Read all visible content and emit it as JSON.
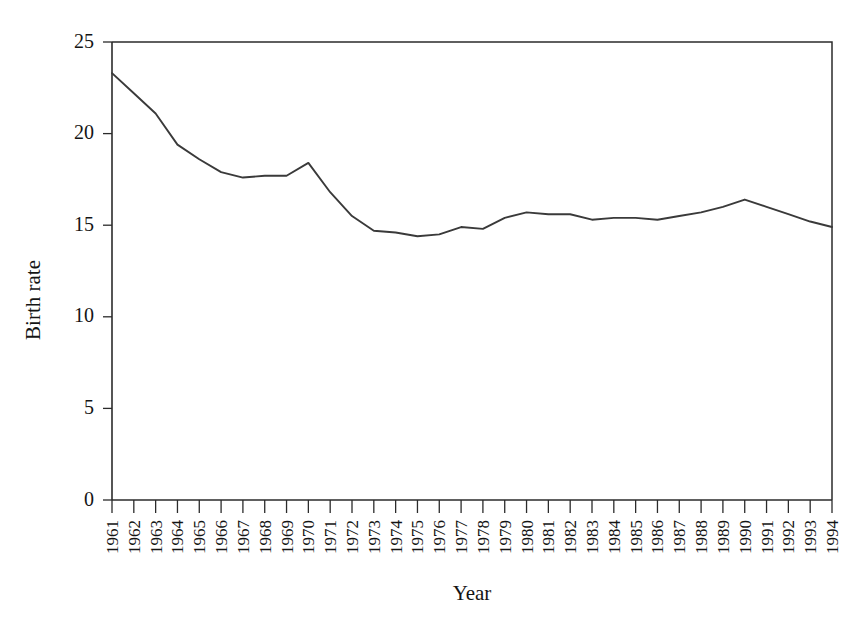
{
  "chart_data": {
    "type": "line",
    "title": "",
    "xlabel": "Year",
    "ylabel": "Birth rate",
    "xlim": [
      1961,
      1994
    ],
    "ylim": [
      0,
      25
    ],
    "yticks": [
      0,
      5,
      10,
      15,
      20,
      25
    ],
    "grid": false,
    "legend": false,
    "line_color": "#3a3a3a",
    "axis_color": "#2b2b2b",
    "background": "#ffffff",
    "categories": [
      "1961",
      "1962",
      "1963",
      "1964",
      "1965",
      "1966",
      "1967",
      "1968",
      "1969",
      "1970",
      "1971",
      "1972",
      "1973",
      "1974",
      "1975",
      "1976",
      "1977",
      "1978",
      "1979",
      "1980",
      "1981",
      "1982",
      "1983",
      "1984",
      "1985",
      "1986",
      "1987",
      "1988",
      "1989",
      "1990",
      "1991",
      "1992",
      "1993",
      "1994"
    ],
    "x": [
      1961,
      1962,
      1963,
      1964,
      1965,
      1966,
      1967,
      1968,
      1969,
      1970,
      1971,
      1972,
      1973,
      1974,
      1975,
      1976,
      1977,
      1978,
      1979,
      1980,
      1981,
      1982,
      1983,
      1984,
      1985,
      1986,
      1987,
      1988,
      1989,
      1990,
      1991,
      1992,
      1993,
      1994
    ],
    "values": [
      23.3,
      22.2,
      21.1,
      19.4,
      18.6,
      17.9,
      17.6,
      17.7,
      17.7,
      18.4,
      16.8,
      15.5,
      14.7,
      14.6,
      14.4,
      14.5,
      14.9,
      14.8,
      15.4,
      15.7,
      15.6,
      15.6,
      15.3,
      15.4,
      15.4,
      15.3,
      15.5,
      15.7,
      16.0,
      16.4,
      16.0,
      15.6,
      15.2,
      14.9
    ],
    "series": [
      {
        "name": "Birth rate",
        "values": [
          23.3,
          22.2,
          21.1,
          19.4,
          18.6,
          17.9,
          17.6,
          17.7,
          17.7,
          18.4,
          16.8,
          15.5,
          14.7,
          14.6,
          14.4,
          14.5,
          14.9,
          14.8,
          15.4,
          15.7,
          15.6,
          15.6,
          15.3,
          15.4,
          15.4,
          15.3,
          15.5,
          15.7,
          16.0,
          16.4,
          16.0,
          15.6,
          15.2,
          14.9
        ]
      }
    ]
  },
  "axes": {
    "y_title": "Birth rate",
    "x_title": "Year"
  }
}
